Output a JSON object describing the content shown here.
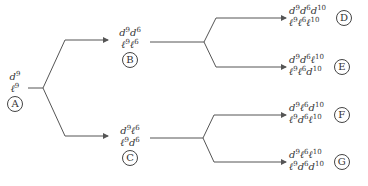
{
  "diagram": {
    "type": "tree",
    "direction": "left-to-right",
    "nodes": {
      "A": {
        "label": "A",
        "lines": [
          [
            [
              "d",
              "9"
            ]
          ],
          [
            [
              "ℓ",
              "9"
            ]
          ]
        ]
      },
      "B": {
        "label": "B",
        "lines": [
          [
            [
              "d",
              "9"
            ],
            [
              "d",
              "6"
            ]
          ],
          [
            [
              "ℓ",
              "9"
            ],
            [
              "ℓ",
              "6"
            ]
          ]
        ]
      },
      "C": {
        "label": "C",
        "lines": [
          [
            [
              "d",
              "9"
            ],
            [
              "ℓ",
              "6"
            ]
          ],
          [
            [
              "ℓ",
              "9"
            ],
            [
              "d",
              "6"
            ]
          ]
        ]
      },
      "D": {
        "label": "D",
        "lines": [
          [
            [
              "d",
              "9"
            ],
            [
              "d",
              "6"
            ],
            [
              "d",
              "10"
            ]
          ],
          [
            [
              "ℓ",
              "9"
            ],
            [
              "ℓ",
              "6"
            ],
            [
              "ℓ",
              "10"
            ]
          ]
        ]
      },
      "E": {
        "label": "E",
        "lines": [
          [
            [
              "d",
              "9"
            ],
            [
              "d",
              "6"
            ],
            [
              "ℓ",
              "10"
            ]
          ],
          [
            [
              "ℓ",
              "9"
            ],
            [
              "ℓ",
              "6"
            ],
            [
              "d",
              "10"
            ]
          ]
        ]
      },
      "F": {
        "label": "F",
        "lines": [
          [
            [
              "d",
              "9"
            ],
            [
              "ℓ",
              "6"
            ],
            [
              "d",
              "10"
            ]
          ],
          [
            [
              "ℓ",
              "9"
            ],
            [
              "d",
              "6"
            ],
            [
              "ℓ",
              "10"
            ]
          ]
        ]
      },
      "G": {
        "label": "G",
        "lines": [
          [
            [
              "d",
              "9"
            ],
            [
              "ℓ",
              "6"
            ],
            [
              "ℓ",
              "10"
            ]
          ],
          [
            [
              "ℓ",
              "9"
            ],
            [
              "d",
              "6"
            ],
            [
              "d",
              "10"
            ]
          ]
        ]
      }
    },
    "edges": [
      [
        "A",
        "B"
      ],
      [
        "A",
        "C"
      ],
      [
        "B",
        "D"
      ],
      [
        "B",
        "E"
      ],
      [
        "C",
        "F"
      ],
      [
        "C",
        "G"
      ]
    ],
    "colors": {
      "line": "#555555",
      "text": "#333333"
    }
  }
}
